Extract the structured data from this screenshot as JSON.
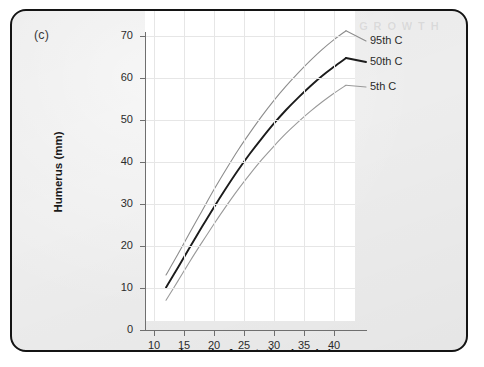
{
  "panel": {
    "label": "(c)",
    "scan_artifact": "G     R     O     W     T     H"
  },
  "chart_data": {
    "type": "line",
    "title": "",
    "xlabel": "Length of gestation (weeks)",
    "ylabel": "Humerus (mm)",
    "xlim": [
      8.5,
      43.5
    ],
    "ylim": [
      0,
      74
    ],
    "xticks": [
      10,
      15,
      20,
      25,
      30,
      35,
      40
    ],
    "yticks": [
      0,
      10,
      20,
      30,
      40,
      50,
      60,
      70
    ],
    "xticklabels": [
      "10",
      "15",
      "20",
      "25",
      "30",
      "35",
      "40"
    ],
    "yticklabels": [
      "0",
      "10",
      "20",
      "30",
      "40",
      "50",
      "60",
      "70"
    ],
    "grid": true,
    "legend_position": "right-inline-annotations",
    "x": [
      12,
      14,
      16,
      18,
      20,
      22,
      24,
      26,
      28,
      30,
      32,
      34,
      36,
      38,
      40,
      42
    ],
    "series": [
      {
        "name": "95th C",
        "label": "95th C",
        "color": "#8d8d8d",
        "width": 1.1,
        "values": [
          13.0,
          18.0,
          23.2,
          28.3,
          33.4,
          38.2,
          42.8,
          47.0,
          51.0,
          54.7,
          58.1,
          61.2,
          64.1,
          66.8,
          69.2,
          71.3
        ]
      },
      {
        "name": "50th C",
        "label": "50th C",
        "color": "#1c1c1c",
        "width": 1.9,
        "values": [
          10.0,
          14.8,
          19.7,
          24.5,
          29.2,
          33.7,
          38.0,
          42.0,
          45.7,
          49.2,
          52.4,
          55.3,
          58.0,
          60.5,
          62.7,
          64.8
        ]
      },
      {
        "name": "5th C",
        "label": "5th C",
        "color": "#9a9a9a",
        "width": 1.1,
        "values": [
          7.0,
          11.6,
          16.3,
          20.8,
          25.2,
          29.4,
          33.4,
          37.1,
          40.6,
          43.8,
          46.8,
          49.5,
          52.0,
          54.3,
          56.4,
          58.3
        ]
      }
    ],
    "annotations": [
      {
        "text": "95th C",
        "series": "95th C"
      },
      {
        "text": "50th C",
        "series": "50th C"
      },
      {
        "text": "5th C",
        "series": "5th C"
      }
    ]
  },
  "colors": {
    "panel_background": "#ededed",
    "plot_background": "#ffffff",
    "frame": "#141414",
    "grid": "#e6e6e6",
    "axis": "#6f6f6f"
  }
}
